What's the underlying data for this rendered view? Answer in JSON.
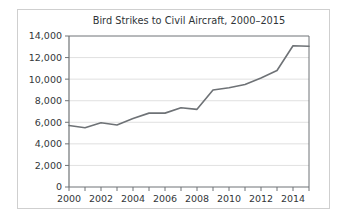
{
  "chart_data": {
    "type": "line",
    "title": "Bird Strikes to Civil Aircraft, 2000–2015",
    "xlabel": "",
    "ylabel": "",
    "x": [
      2000,
      2001,
      2002,
      2003,
      2004,
      2005,
      2006,
      2007,
      2008,
      2009,
      2010,
      2011,
      2012,
      2013,
      2014,
      2015
    ],
    "values": [
      5700,
      5500,
      5950,
      5750,
      6350,
      6850,
      6850,
      7350,
      7200,
      9000,
      9200,
      9500,
      10100,
      10800,
      13100,
      13050
    ],
    "series": [
      {
        "name": "Bird strikes",
        "values": [
          5700,
          5500,
          5950,
          5750,
          6350,
          6850,
          6850,
          7350,
          7200,
          9000,
          9200,
          9500,
          10100,
          10800,
          13100,
          13050
        ]
      }
    ],
    "xlim": [
      2000,
      2015
    ],
    "ylim": [
      0,
      14000
    ],
    "y_ticks": [
      0,
      2000,
      4000,
      6000,
      8000,
      10000,
      12000,
      14000
    ],
    "y_tick_labels": [
      "0",
      "2,000",
      "4,000",
      "6,000",
      "8,000",
      "10,000",
      "12,000",
      "14,000"
    ],
    "x_ticks": [
      2000,
      2001,
      2002,
      2003,
      2004,
      2005,
      2006,
      2007,
      2008,
      2009,
      2010,
      2011,
      2012,
      2013,
      2014,
      2015
    ],
    "x_major_ticks": [
      2000,
      2002,
      2004,
      2006,
      2008,
      2010,
      2012,
      2014
    ],
    "x_tick_labels": [
      "2000",
      "2002",
      "2004",
      "2006",
      "2008",
      "2010",
      "2012",
      "2014"
    ],
    "grid": "horizontal",
    "legend": "none",
    "colors": {
      "line": "#6e7276",
      "grid": "#d8d8d8",
      "axis": "#6f7376",
      "text": "#33373a",
      "border": "#cfcfcf",
      "background": "#ffffff"
    }
  }
}
